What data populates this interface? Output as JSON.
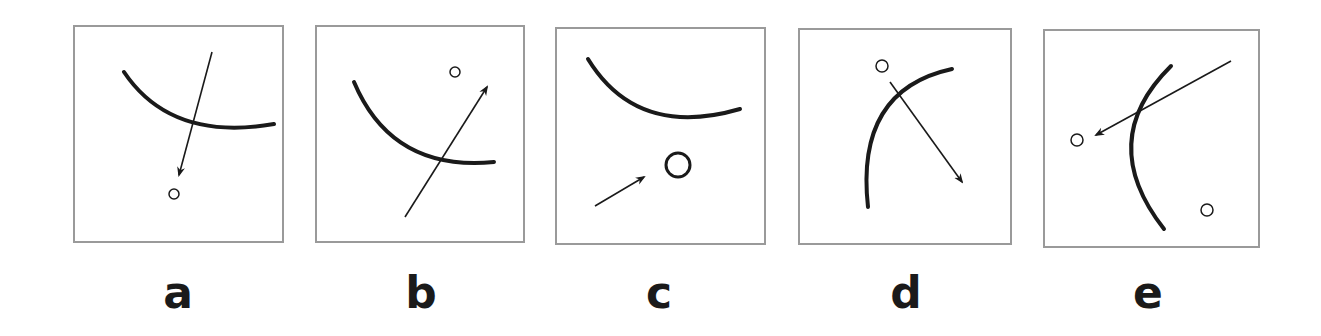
{
  "figure": {
    "stroke_color": "#1a1a1a",
    "border_color": "#9a9a9a",
    "panels": [
      {
        "label": "a",
        "box": {
          "x": 73,
          "y": 25,
          "w": 211,
          "h": 218
        },
        "arc": "M49 45 Q 96 115 199 97",
        "arrow": {
          "x1": 137,
          "y1": 25,
          "x2": 104,
          "y2": 148
        },
        "circles": [
          {
            "cx": 99,
            "cy": 167,
            "r": 5
          }
        ]
      },
      {
        "label": "b",
        "box": {
          "x": 315,
          "y": 25,
          "w": 210,
          "h": 218
        },
        "arc": "M37 55 Q 75 145 177 135",
        "arrow": {
          "x1": 88,
          "y1": 190,
          "x2": 170,
          "y2": 60
        },
        "circles": [
          {
            "cx": 138,
            "cy": 45,
            "r": 5
          }
        ]
      },
      {
        "label": "c",
        "box": {
          "x": 555,
          "y": 27,
          "w": 211,
          "h": 218
        },
        "arc": "M31 30 Q 80 110 183 80",
        "arrow": {
          "x1": 38,
          "y1": 177,
          "x2": 87,
          "y2": 148
        },
        "circles": [
          {
            "cx": 121,
            "cy": 136,
            "r": 12
          }
        ]
      },
      {
        "label": "d",
        "box": {
          "x": 798,
          "y": 28,
          "w": 214,
          "h": 217
        },
        "arc": "M68 177 Q 55 60 152 39",
        "arrow": {
          "x1": 90,
          "y1": 52,
          "x2": 162,
          "y2": 152
        },
        "circles": [
          {
            "cx": 82,
            "cy": 36,
            "r": 6
          }
        ]
      },
      {
        "label": "e",
        "box": {
          "x": 1043,
          "y": 29,
          "w": 217,
          "h": 219
        },
        "arc": "M126 35 Q 50 110 119 198",
        "arrow": {
          "x1": 186,
          "y1": 30,
          "x2": 51,
          "y2": 104
        },
        "circles": [
          {
            "cx": 32,
            "cy": 109,
            "r": 6
          },
          {
            "cx": 162,
            "cy": 179,
            "r": 6
          }
        ]
      }
    ]
  }
}
